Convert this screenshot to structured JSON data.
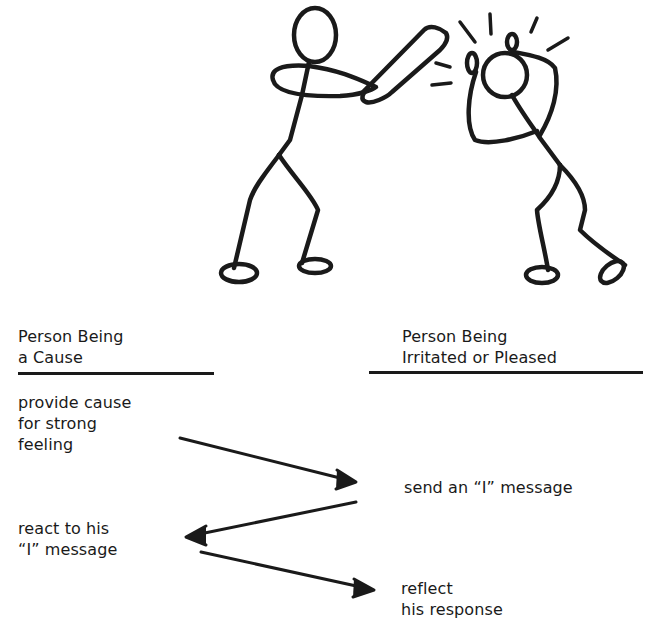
{
  "illustration": {
    "description": "Stick figure swinging a bat at another stick figure who clutches his head",
    "figures": [
      "person-with-bat",
      "person-being-hit"
    ]
  },
  "columns": {
    "left": {
      "heading_line1": "Person Being",
      "heading_line2": "a Cause"
    },
    "right": {
      "heading_line1": "Person Being",
      "heading_line2": "Irritated or Pleased"
    }
  },
  "steps": [
    {
      "side": "left",
      "line1": "provide cause",
      "line2": "for strong",
      "line3": "feeling"
    },
    {
      "side": "right",
      "line1": "send an “I” message"
    },
    {
      "side": "left",
      "line1": "react to his",
      "line2": "“I” message"
    },
    {
      "side": "right",
      "line1": "reflect",
      "line2": "his response"
    }
  ],
  "arrows": [
    {
      "from": "step-1",
      "to": "step-2",
      "direction": "right"
    },
    {
      "from": "step-2",
      "to": "step-3",
      "direction": "left"
    },
    {
      "from": "step-3",
      "to": "step-4",
      "direction": "right"
    }
  ],
  "colors": {
    "ink": "#1a1a1a",
    "paper": "#ffffff"
  }
}
